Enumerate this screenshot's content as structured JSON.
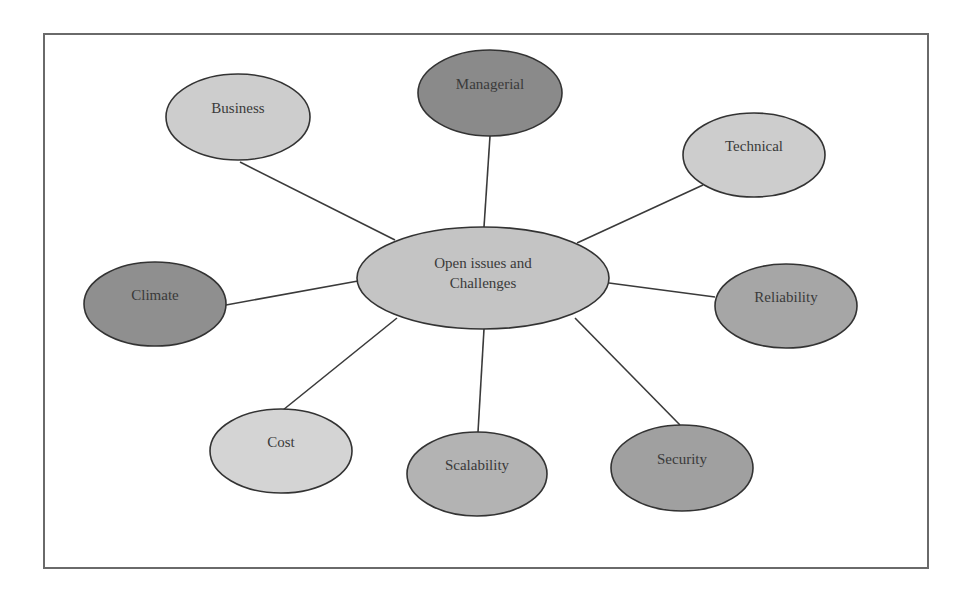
{
  "diagram": {
    "center": {
      "id": "open-issues",
      "lines": [
        "Open issues and",
        "Challenges"
      ],
      "cx": 483,
      "cy": 278,
      "rx": 126,
      "ry": 51,
      "fill": "#c4c4c4"
    },
    "nodes": [
      {
        "id": "business",
        "label": "Business",
        "cx": 238,
        "cy": 117,
        "rx": 72,
        "ry": 43,
        "fill": "#cdcdcd",
        "edge_from": [
          240,
          162
        ],
        "edge_to": [
          395,
          240
        ]
      },
      {
        "id": "managerial",
        "label": "Managerial",
        "cx": 490,
        "cy": 93,
        "rx": 72,
        "ry": 43,
        "fill": "#8a8a8a",
        "edge_from": [
          490,
          136
        ],
        "edge_to": [
          484,
          227
        ]
      },
      {
        "id": "technical",
        "label": "Technical",
        "cx": 754,
        "cy": 155,
        "rx": 71,
        "ry": 42,
        "fill": "#cdcdcd",
        "edge_from": [
          703,
          185
        ],
        "edge_to": [
          577,
          243
        ]
      },
      {
        "id": "climate",
        "label": "Climate",
        "cx": 155,
        "cy": 304,
        "rx": 71,
        "ry": 42,
        "fill": "#8f8f8f",
        "edge_from": [
          226,
          305
        ],
        "edge_to": [
          358,
          281
        ]
      },
      {
        "id": "reliability",
        "label": "Reliability",
        "cx": 786,
        "cy": 306,
        "rx": 71,
        "ry": 42,
        "fill": "#a6a6a6",
        "edge_from": [
          715,
          297
        ],
        "edge_to": [
          609,
          283
        ]
      },
      {
        "id": "cost",
        "label": "Cost",
        "cx": 281,
        "cy": 451,
        "rx": 71,
        "ry": 42,
        "fill": "#d4d4d4",
        "edge_from": [
          283,
          410
        ],
        "edge_to": [
          397,
          318
        ]
      },
      {
        "id": "scalability",
        "label": "Scalability",
        "cx": 477,
        "cy": 474,
        "rx": 70,
        "ry": 42,
        "fill": "#b3b3b3",
        "edge_from": [
          478,
          432
        ],
        "edge_to": [
          484,
          329
        ]
      },
      {
        "id": "security",
        "label": "Security",
        "cx": 682,
        "cy": 468,
        "rx": 71,
        "ry": 43,
        "fill": "#a0a0a0",
        "edge_from": [
          680,
          425
        ],
        "edge_to": [
          575,
          318
        ]
      }
    ],
    "stroke": "#333333",
    "edge_color": "#3a3a3a"
  }
}
